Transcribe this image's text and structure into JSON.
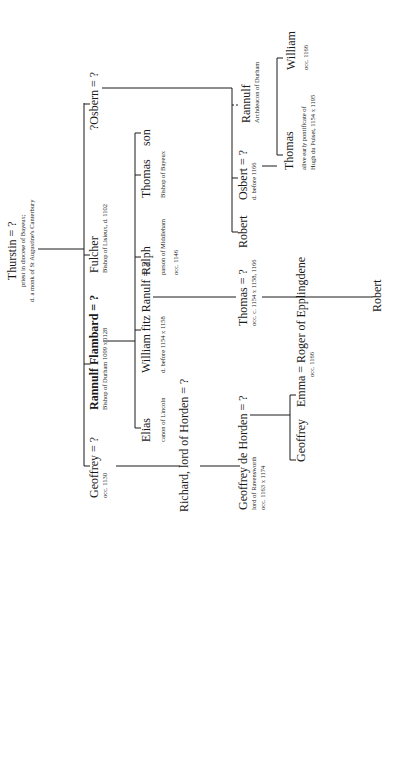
{
  "nodes": {
    "thurstin": {
      "name": "Thurstin = ?",
      "note1": "priest in diocese of Bayeux;",
      "note2": "d. a monk of St Augustine's Canterbury"
    },
    "geoffrey": {
      "name": "Geoffrey = ?",
      "note1": "occ. 1130"
    },
    "rannulf_flambard": {
      "name": "Rannulf Flambard = ?",
      "note1": "Bishop of Durham 1099 x 1128"
    },
    "fulcher": {
      "name": "Fulcher",
      "note1": "Bishop of Lisieux, d. 1102"
    },
    "osbern": {
      "name": "?Osbern = ?"
    },
    "richard": {
      "name": "Richard, lord of Horden = ?"
    },
    "elias": {
      "name": "Elias",
      "note1": "canon of Lincoln"
    },
    "william_fitz_ranulf": {
      "name": "William fitz Ranulf = ?",
      "note1": "d. before 1154 x 1158"
    },
    "ralph": {
      "name": "Ralph",
      "note1": "parson of Middleham",
      "note2": "occ. 1146"
    },
    "thomas_bayeux": {
      "name": "Thomas",
      "note1": "Bishop of Bayeux"
    },
    "son": {
      "name": "son"
    },
    "geoffrey_de_horden": {
      "name": "Geoffrey de Horden = ?",
      "note1": "lord of Ravensworth",
      "note2": "occ. 1163 x 1174"
    },
    "thomas_occ": {
      "name": "Thomas = ?",
      "note1": "occ. c. 1154 x 1158, 1166"
    },
    "robert_osbern": {
      "name": "Robert"
    },
    "osbert": {
      "name": "Osbert = ?",
      "note1": "d. before 1166"
    },
    "rannulf_archdeacon": {
      "name": "Rannulf",
      "note1": "Archdeacon of Durham"
    },
    "geoffrey_child": {
      "name": "Geoffrey"
    },
    "emma": {
      "name": "Emma = Roger of Epplingdene",
      "note1": "occ. 1166"
    },
    "robert_thomas": {
      "name": "Robert"
    },
    "thomas_hugh": {
      "name": "Thomas",
      "note1": "alive early pontificate of",
      "note2": "Hugh du Puiset, 1154 x 1195"
    },
    "william_osbert": {
      "name": "William",
      "note1": "occ. 1166"
    }
  },
  "colors": {
    "line": "#1a1a1a",
    "background": "#ffffff"
  }
}
